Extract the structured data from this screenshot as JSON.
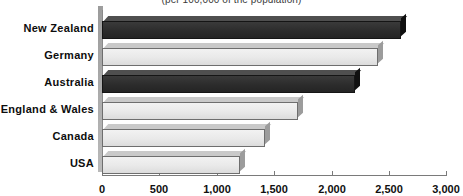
{
  "chart_data": {
    "type": "bar",
    "orientation": "horizontal",
    "title": "",
    "subtitle": "(per 100,000 of the population)",
    "xlabel": "",
    "ylabel": "",
    "categories": [
      "New Zealand",
      "Germany",
      "Australia",
      "England & Wales",
      "Canada",
      "USA"
    ],
    "values": [
      2600,
      2400,
      2200,
      1700,
      1420,
      1200
    ],
    "series": [
      {
        "name": "Rate per 100,000",
        "values": [
          2600,
          2400,
          2200,
          1700,
          1420,
          1200
        ]
      }
    ],
    "bar_colors": [
      "dark",
      "light",
      "dark",
      "light",
      "light",
      "light"
    ],
    "xlim": [
      0,
      3000
    ],
    "xticks": [
      0,
      500,
      1000,
      1500,
      2000,
      2500,
      3000
    ],
    "xtick_labels": [
      "0",
      "500",
      "1,000",
      "1,500",
      "2,000",
      "2,500",
      "3,000"
    ],
    "grid": false,
    "legend": "none",
    "style": "3d-bar"
  },
  "axis": {
    "tick_labels": [
      "0",
      "500",
      "1,000",
      "1,500",
      "2,000",
      "2,500",
      "3,000"
    ]
  },
  "categories": {
    "c0": "New Zealand",
    "c1": "Germany",
    "c2": "Australia",
    "c3": "England & Wales",
    "c4": "Canada",
    "c5": "USA"
  },
  "colors": {
    "bar_dark": "#2b2b2b",
    "bar_light": "#e9e9e9",
    "axis": "#7a7a7a",
    "text": "#0d0d0d",
    "background": "#ffffff"
  }
}
